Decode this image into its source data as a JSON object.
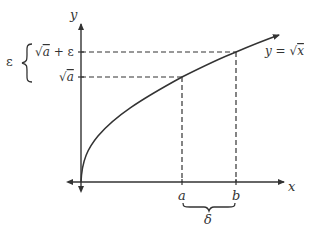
{
  "diagram": {
    "colors": {
      "stroke": "#333333",
      "background": "#ffffff"
    },
    "axes": {
      "x_label": "x",
      "y_label": "y"
    },
    "curve": {
      "label": "y = √x",
      "label_prefix": "y = ",
      "label_radical": "√",
      "label_var": "x"
    },
    "x_ticks": [
      {
        "label": "a"
      },
      {
        "label": "b"
      }
    ],
    "y_ticks": [
      {
        "label": "√a + ε",
        "radical": "√",
        "var": "a",
        "suffix": " + ε"
      },
      {
        "label": "√a",
        "radical": "√",
        "var": "a"
      }
    ],
    "epsilon_brace": {
      "label": "ε",
      "brace": "{"
    },
    "delta_brace": {
      "label": "δ"
    }
  }
}
